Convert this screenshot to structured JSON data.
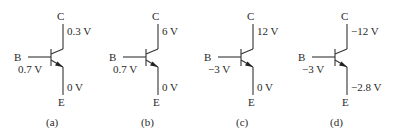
{
  "figure": {
    "transistors": [
      {
        "id": "a",
        "caption": "(a)",
        "offset_x": 0,
        "collector_label": "C",
        "emitter_label": "E",
        "base_label": "B",
        "collector_voltage": "0.3 V",
        "base_voltage": "0.7 V",
        "emitter_voltage": "0 V"
      },
      {
        "id": "b",
        "caption": "(b)",
        "offset_x": 95,
        "collector_label": "C",
        "emitter_label": "E",
        "base_label": "B",
        "collector_voltage": "6 V",
        "base_voltage": "0.7 V",
        "emitter_voltage": "0 V"
      },
      {
        "id": "c",
        "caption": "(c)",
        "offset_x": 190,
        "collector_label": "C",
        "emitter_label": "E",
        "base_label": "B",
        "collector_voltage": "12 V",
        "base_voltage": "−3 V",
        "emitter_voltage": "0 V"
      },
      {
        "id": "d",
        "caption": "(d)",
        "offset_x": 284,
        "collector_label": "C",
        "emitter_label": "E",
        "base_label": "B",
        "collector_voltage": "−12 V",
        "base_voltage": "−3 V",
        "emitter_voltage": "−2.8 V"
      }
    ],
    "symbol": "npn-transistor",
    "line_color": "#333333"
  }
}
